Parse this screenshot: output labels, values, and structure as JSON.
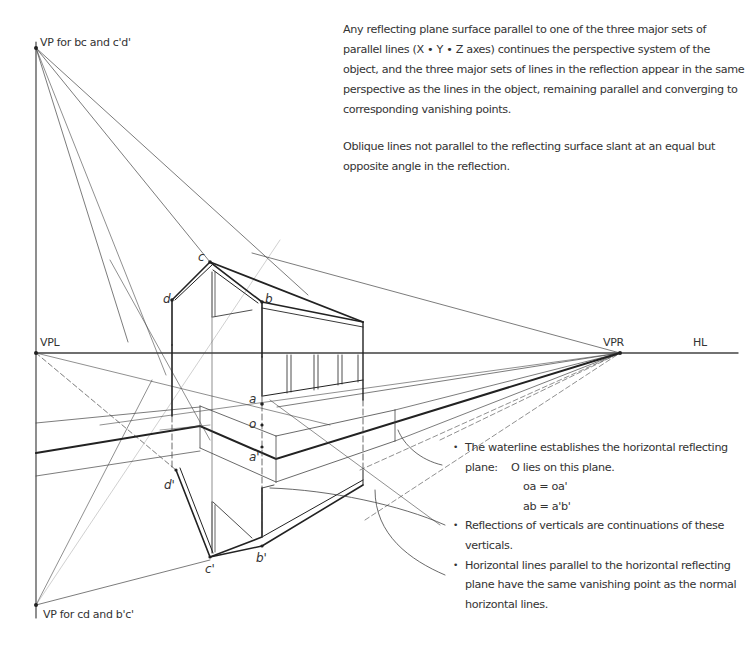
{
  "intro_text": {
    "paragraph_1": "Any reflecting plane surface parallel to one of the three major sets of parallel lines (X • Y • Z axes) continues the perspective system of the object, and the three major sets of lines in the reflection appear in the same perspective as the lines in the object, remaining parallel and converging to corresponding vanishing points.",
    "paragraph_2": "Oblique lines not parallel to the reflecting surface slant at an equal but opposite angle in the reflection."
  },
  "labels": {
    "vp_top": "VP for bc and c'd'",
    "vp_bottom": "VP for cd and b'c'",
    "vpl": "VPL",
    "vpr": "VPR",
    "hl": "HL"
  },
  "points": {
    "c": "c",
    "b": "b",
    "d": "d",
    "a": "a",
    "o": "o",
    "a_prime": "a'",
    "d_prime": "d'",
    "c_prime": "c'",
    "b_prime": "b'"
  },
  "notes": {
    "bullet_1": "The waterline establishes the horizontal reflecting",
    "bullet_1_plane_key": "plane:",
    "bullet_1_plane_value": "O lies on this plane.",
    "eq_1": "oa = oa'",
    "eq_2": "ab = a'b'",
    "bullet_2": "Reflections of verticals are continuations of these verticals.",
    "bullet_3": "Horizontal lines parallel to the horizontal reflecting plane have the same vanishing point as the normal horizontal lines."
  }
}
